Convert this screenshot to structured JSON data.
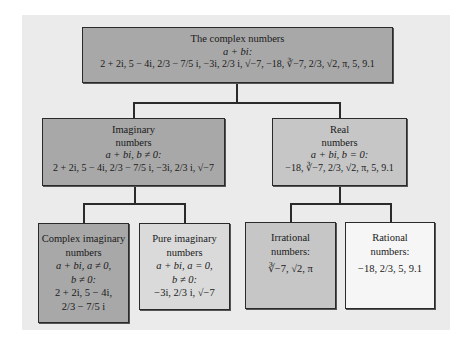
{
  "diagram": {
    "colors": {
      "panel_bg": "#ebebeb",
      "dark_box": "#a8a8a8",
      "mid_box": "#c6c6c6",
      "light_box": "#dadada",
      "lightest_box": "#f6f6f6",
      "border": "#2a2a2a"
    },
    "nodes": {
      "complex": {
        "title": "The complex numbers",
        "form": "a + bi:",
        "examples": "2 + 2i, 5 − 4i, 2/3 − 7/5 i, −3i, 2/3 i, √−7, −18, ∛−7, 2/3, √2, π, 5, 9.1"
      },
      "imaginary": {
        "title_line1": "Imaginary",
        "title_line2": "numbers",
        "form": "a + bi, b ≠ 0:",
        "examples": "2 + 2i, 5 − 4i, 2/3 − 7/5 i, −3i, 2/3 i, √−7"
      },
      "real": {
        "title_line1": "Real",
        "title_line2": "numbers",
        "form": "a + bi, b = 0:",
        "examples": "−18, ∛−7, 2/3, √2, π, 5, 9.1"
      },
      "complex_imaginary": {
        "title_line1": "Complex imaginary",
        "title_line2": "numbers",
        "form_line1": "a + bi, a ≠ 0,",
        "form_line2": "b ≠ 0:",
        "examples_line1": "2 + 2i, 5 − 4i,",
        "examples_line2": "2/3 − 7/5 i"
      },
      "pure_imaginary": {
        "title_line1": "Pure imaginary",
        "title_line2": "numbers",
        "form_line1": "a + bi, a = 0,",
        "form_line2": "b ≠ 0:",
        "examples": "−3i, 2/3 i, √−7"
      },
      "irrational": {
        "title_line1": "Irrational",
        "title_line2": "numbers:",
        "examples": "∛−7, √2, π"
      },
      "rational": {
        "title_line1": "Rational",
        "title_line2": "numbers:",
        "examples": "−18, 2/3, 5, 9.1"
      }
    },
    "edges": [
      [
        "complex",
        "imaginary"
      ],
      [
        "complex",
        "real"
      ],
      [
        "imaginary",
        "complex_imaginary"
      ],
      [
        "imaginary",
        "pure_imaginary"
      ],
      [
        "real",
        "irrational"
      ],
      [
        "real",
        "rational"
      ]
    ]
  }
}
